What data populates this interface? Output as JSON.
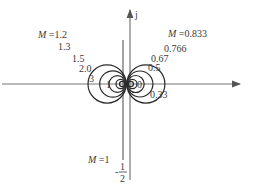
{
  "diagram": {
    "title": "",
    "axis": {
      "imag_label": "j"
    },
    "m1_line": {
      "label": "M =1",
      "value_numerator": "1",
      "value_denominator": "2",
      "value_sign": "-"
    },
    "left_circles": [
      {
        "M": 1.2,
        "label": "M =1.2"
      },
      {
        "M": 1.3,
        "label": "1.3"
      },
      {
        "M": 1.5,
        "label": "1.5"
      },
      {
        "M": 2.0,
        "label": "2.0"
      },
      {
        "M": 3,
        "label": "3"
      }
    ],
    "right_circles": [
      {
        "M": 0.833,
        "label": "M =0.833"
      },
      {
        "M": 0.766,
        "label": "0.766"
      },
      {
        "M": 0.67,
        "label": "0.67"
      },
      {
        "M": 0.5,
        "label": "0.5"
      },
      {
        "M": 0.33,
        "label": "0.33"
      }
    ],
    "center_labels": {
      "left": "1",
      "right": "0"
    }
  }
}
